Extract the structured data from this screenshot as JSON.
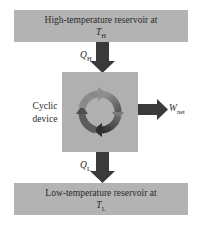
{
  "diagram": {
    "type": "heat-engine-schematic",
    "high_reservoir": {
      "line1": "High-temperature reservoir at",
      "symbol": "T",
      "subscript": "H"
    },
    "low_reservoir": {
      "line1": "Low-temperature reservoir at",
      "symbol": "T",
      "subscript": "L"
    },
    "device": {
      "line1": "Cyclic",
      "line2": "device"
    },
    "heat_in": {
      "symbol": "Q",
      "subscript": "H"
    },
    "heat_out": {
      "symbol": "Q",
      "subscript": "L"
    },
    "work_out": {
      "symbol": "W",
      "subscript": "net"
    },
    "colors": {
      "reservoir": "#b3b3b3",
      "device": "#b0b0b0",
      "arrow": "#3a3a3a",
      "text": "#2a2a2a"
    }
  }
}
